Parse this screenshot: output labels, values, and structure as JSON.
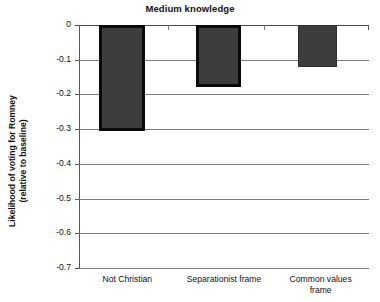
{
  "chart_data": {
    "type": "bar",
    "title": "Medium knowledge",
    "xlabel": "",
    "ylabel": "Likelihood of voting for Romney (relative to baseline)",
    "ylabel_line1": "Likelihood of voting for Romney",
    "ylabel_line2": "(relative to baseline)",
    "categories": [
      "Not Christian",
      "Separationist frame",
      "Common values frame"
    ],
    "category_lines": [
      [
        "Not Christian"
      ],
      [
        "Separationist frame"
      ],
      [
        "Common values",
        "frame"
      ]
    ],
    "values": [
      -0.305,
      -0.18,
      -0.12
    ],
    "ylim": [
      -0.7,
      0
    ],
    "yticks": [
      0,
      -0.1,
      -0.2,
      -0.3,
      -0.4,
      -0.5,
      -0.6,
      -0.7
    ],
    "ytick_labels": [
      "0",
      "-0.1",
      "-0.2",
      "-0.3",
      "-0.4",
      "-0.5",
      "-0.6",
      "-0.7"
    ],
    "grid": true,
    "legend": null,
    "bar_styles": [
      "outlined",
      "outlined",
      "plain"
    ],
    "colors": {
      "bar_fill": "#3d3d3d",
      "bar_outline": "#0a0a0a",
      "gridline": "#7a7a7a",
      "axis": "#555555",
      "text": "#111111",
      "background": "#ffffff"
    }
  }
}
